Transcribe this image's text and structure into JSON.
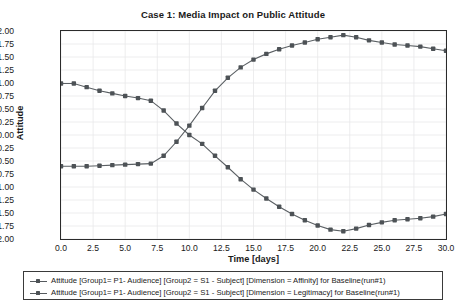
{
  "chart_data": {
    "type": "line",
    "title": "Case 1: Media Impact on Public Attitude",
    "xlabel": "Time [days]",
    "ylabel": "Attitude",
    "xlim": [
      0,
      30
    ],
    "ylim": [
      -2.0,
      2.0
    ],
    "xticks": [
      "0.0",
      "2.5",
      "5.0",
      "7.5",
      "10.0",
      "12.5",
      "15.0",
      "17.5",
      "20.0",
      "22.5",
      "25.0",
      "27.5",
      "30.0"
    ],
    "xtick_values": [
      0,
      2.5,
      5,
      7.5,
      10,
      12.5,
      15,
      17.5,
      20,
      22.5,
      25,
      27.5,
      30
    ],
    "yticks": [
      "2.00",
      "1.75",
      "1.50",
      "1.25",
      "1.00",
      "0.75",
      "0.50",
      "0.25",
      "0.00",
      "-0.25",
      "-0.50",
      "-0.75",
      "-1.00",
      "-1.25",
      "-1.50",
      "-1.75",
      "-2.00"
    ],
    "ytick_values": [
      2.0,
      1.75,
      1.5,
      1.25,
      1.0,
      0.75,
      0.5,
      0.25,
      0.0,
      -0.25,
      -0.5,
      -0.75,
      -1.0,
      -1.25,
      -1.5,
      -1.75,
      -2.0
    ],
    "grid": true,
    "legend_position": "below",
    "marker": "square",
    "line_color": "#5a5f63",
    "marker_color": "#4d5256",
    "x": [
      0,
      1,
      2,
      3,
      4,
      5,
      6,
      7,
      8,
      9,
      10,
      11,
      12,
      13,
      14,
      15,
      16,
      17,
      18,
      19,
      20,
      21,
      22,
      23,
      24,
      25,
      26,
      27,
      28,
      29,
      30
    ],
    "series": [
      {
        "name": "Attitude [Group1= P1- Audience] [Group2 = S1 - Subject] [Dimension = Affinity] for Baseline(run#1)",
        "values": [
          -0.6,
          -0.6,
          -0.6,
          -0.59,
          -0.58,
          -0.57,
          -0.56,
          -0.55,
          -0.4,
          -0.13,
          0.18,
          0.52,
          0.85,
          1.1,
          1.3,
          1.45,
          1.56,
          1.65,
          1.72,
          1.78,
          1.84,
          1.88,
          1.92,
          1.88,
          1.82,
          1.78,
          1.74,
          1.72,
          1.7,
          1.66,
          1.62
        ]
      },
      {
        "name": "Attitude [Group1= P1- Audience] [Group2 = S1 - Subject] [Dimension = Legitimacy] for Baseline(run#1)",
        "values": [
          0.99,
          0.99,
          0.92,
          0.85,
          0.8,
          0.75,
          0.71,
          0.66,
          0.47,
          0.22,
          0.0,
          -0.17,
          -0.4,
          -0.62,
          -0.85,
          -1.05,
          -1.22,
          -1.38,
          -1.52,
          -1.64,
          -1.74,
          -1.82,
          -1.85,
          -1.8,
          -1.73,
          -1.68,
          -1.64,
          -1.62,
          -1.6,
          -1.57,
          -1.52
        ]
      }
    ]
  }
}
